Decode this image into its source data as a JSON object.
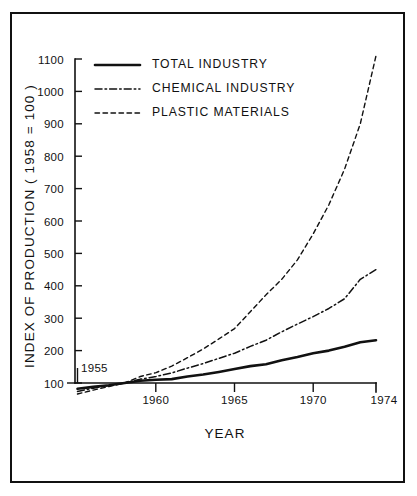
{
  "figure": {
    "background_color": "#ffffff",
    "ink_color": "#111111",
    "border": true
  },
  "chart_data": {
    "type": "line",
    "title": "",
    "xlabel": "YEAR",
    "ylabel": "INDEX OF PRODUCTION ( 1958 = 100 )",
    "xlim": [
      1955,
      1974
    ],
    "ylim": [
      60,
      1120
    ],
    "grid": false,
    "legend_position": "top-left",
    "x_ticks": [
      1955,
      1960,
      1965,
      1970,
      1974
    ],
    "x_tick_labels": [
      "1955",
      "1960",
      "1965",
      "1970",
      "1974"
    ],
    "y_ticks": [
      100,
      200,
      300,
      400,
      500,
      600,
      700,
      800,
      900,
      1000,
      1100
    ],
    "y_tick_labels": [
      "100",
      "200",
      "300",
      "400",
      "500",
      "600",
      "700",
      "800",
      "900",
      "1000",
      "1100"
    ],
    "start_year_annotation": "1955",
    "x": [
      1955,
      1956,
      1957,
      1958,
      1959,
      1960,
      1961,
      1962,
      1963,
      1964,
      1965,
      1966,
      1967,
      1968,
      1969,
      1970,
      1971,
      1972,
      1973,
      1974
    ],
    "series": [
      {
        "name": "TOTAL INDUSTRY",
        "style": "solid",
        "values": [
          82,
          88,
          93,
          100,
          107,
          110,
          112,
          120,
          126,
          134,
          143,
          152,
          158,
          170,
          180,
          192,
          200,
          212,
          226,
          232
        ]
      },
      {
        "name": "CHEMICAL INDUSTRY",
        "style": "dash-dot",
        "values": [
          74,
          84,
          92,
          100,
          112,
          120,
          131,
          146,
          160,
          176,
          192,
          213,
          232,
          258,
          282,
          305,
          330,
          360,
          420,
          450
        ]
      },
      {
        "name": "PLASTIC MATERIALS",
        "style": "dashed",
        "values": [
          66,
          78,
          89,
          100,
          120,
          132,
          152,
          178,
          205,
          236,
          268,
          320,
          372,
          420,
          480,
          560,
          650,
          760,
          900,
          1110
        ]
      }
    ]
  },
  "legend": {
    "entries": [
      {
        "label": "TOTAL INDUSTRY",
        "style": "solid"
      },
      {
        "label": "CHEMICAL INDUSTRY",
        "style": "dash-dot"
      },
      {
        "label": "PLASTIC MATERIALS",
        "style": "dashed"
      }
    ]
  }
}
